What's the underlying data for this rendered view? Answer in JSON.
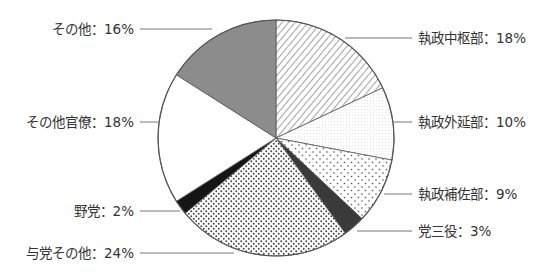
{
  "chart_data": {
    "type": "pie",
    "title": "",
    "start_angle_deg": 0,
    "direction": "clockwise",
    "slices": [
      {
        "label": "執政中枢部",
        "value": 18,
        "text": "執政中枢部：18%",
        "pattern": "diagonal-hatch"
      },
      {
        "label": "執政外延部",
        "value": 10,
        "text": "執政外延部：10%",
        "pattern": "fine-light-dots"
      },
      {
        "label": "執政補佐部",
        "value": 9,
        "text": "執政補佐部：9%",
        "pattern": "sparse-dots"
      },
      {
        "label": "党三役",
        "value": 3,
        "text": "党三役：3%",
        "pattern": "dark-gray"
      },
      {
        "label": "与党その他",
        "value": 24,
        "text": "与党その他：24%",
        "pattern": "dense-dots"
      },
      {
        "label": "野党",
        "value": 2,
        "text": "野党：2%",
        "pattern": "black"
      },
      {
        "label": "その他官僚",
        "value": 18,
        "text": "その他官僚：18%",
        "pattern": "white"
      },
      {
        "label": "その他",
        "value": 16,
        "text": "その他：16%",
        "pattern": "medium-gray"
      }
    ],
    "legend": "callout labels with leader lines",
    "unit": "%"
  },
  "colors": {
    "outline": "#555555",
    "text": "#333333",
    "leader": "#777777",
    "medium_gray": "#8c8c8c",
    "dark_gray": "#3a3a3a",
    "black": "#151515",
    "hatch": "#555555",
    "dot": "#444444"
  }
}
